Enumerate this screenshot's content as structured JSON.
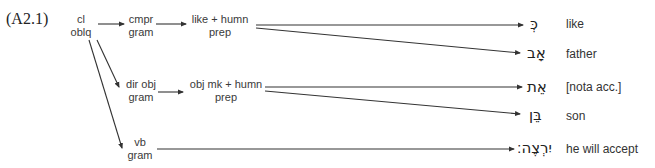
{
  "example_number": "(A2.1)",
  "nodes": {
    "cl_oblq": {
      "line1": "cl",
      "line2": "oblq"
    },
    "cmpr_gram": {
      "line1": "cmpr",
      "line2": "gram"
    },
    "like_humn_prep": {
      "line1": "like + humn",
      "line2": "prep"
    },
    "dir_obj_gram": {
      "line1": "dir obj",
      "line2": "gram"
    },
    "obj_mk_humn_prep": {
      "line1": "obj mk + humn",
      "line2": "prep"
    },
    "vb_gram": {
      "line1": "vb",
      "line2": "gram"
    }
  },
  "words": [
    {
      "hebrew": "כְּ",
      "gloss": "like"
    },
    {
      "hebrew": "אָב",
      "gloss": "father"
    },
    {
      "hebrew": "אֵת",
      "gloss": "[nota acc.]"
    },
    {
      "hebrew": "בֵּן",
      "gloss": "son"
    },
    {
      "hebrew": "יִרְצֶה׃",
      "gloss": "he will accept"
    }
  ],
  "colors": {
    "line": "#333333",
    "text": "#3a3a3a"
  }
}
